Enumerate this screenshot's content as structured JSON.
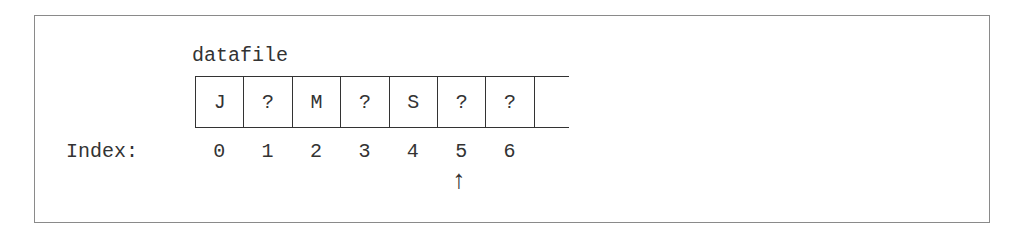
{
  "diagram": {
    "array_name": "datafile",
    "index_label": "Index:",
    "cells": [
      {
        "index": "0",
        "value": "J"
      },
      {
        "index": "1",
        "value": "?"
      },
      {
        "index": "2",
        "value": "M"
      },
      {
        "index": "3",
        "value": "?"
      },
      {
        "index": "4",
        "value": "S"
      },
      {
        "index": "5",
        "value": "?"
      },
      {
        "index": "6",
        "value": "?"
      }
    ],
    "pointer": {
      "glyph": "↑",
      "at_index": "5"
    },
    "colors": {
      "frame": "#8a8a8a",
      "ink": "#333333",
      "background": "#ffffff"
    }
  }
}
